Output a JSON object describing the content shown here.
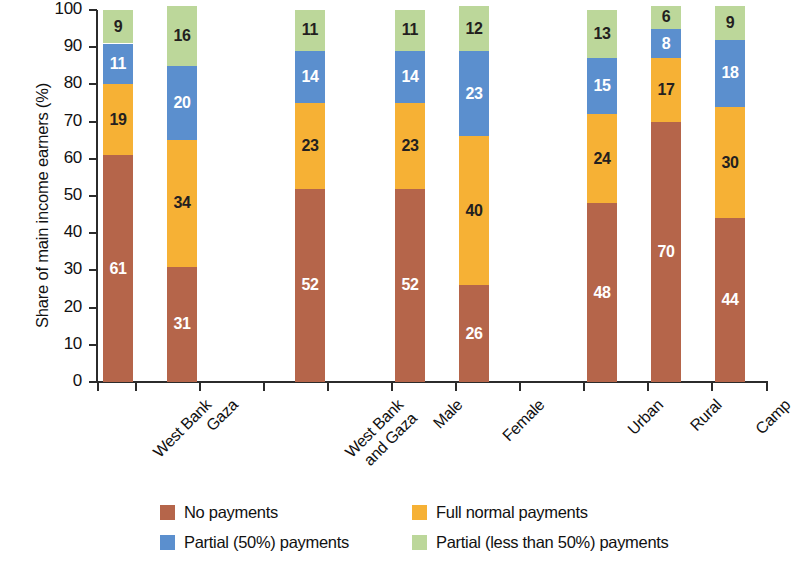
{
  "chart_data": {
    "type": "bar",
    "subtype": "stacked-100-percent",
    "title": "",
    "xlabel": "",
    "ylabel": "Share of main income earners (%)",
    "ylim": [
      0,
      100
    ],
    "ytick_values": [
      0,
      10,
      20,
      30,
      40,
      50,
      60,
      70,
      80,
      90,
      100
    ],
    "ytick_labels": [
      "0",
      "10",
      "20",
      "30",
      "40",
      "50",
      "60",
      "70",
      "80",
      "90",
      "100"
    ],
    "grid": false,
    "legend_position": "bottom",
    "categories": [
      "West Bank",
      "Gaza",
      "West Bank and Gaza",
      "Male",
      "Female",
      "Urban",
      "Rural",
      "Camp"
    ],
    "category_label_lines": [
      [
        "West Bank"
      ],
      [
        "Gaza"
      ],
      [
        "West Bank",
        "and Gaza"
      ],
      [
        "Male"
      ],
      [
        "Female"
      ],
      [
        "Urban"
      ],
      [
        "Rural"
      ],
      [
        "Camp"
      ]
    ],
    "series": [
      {
        "name": "No payments",
        "color": "#b5654a",
        "label_color": "light",
        "values": [
          61,
          31,
          52,
          52,
          26,
          48,
          70,
          44
        ]
      },
      {
        "name": "Full normal payments",
        "color": "#f6b135",
        "label_color": "dark",
        "values": [
          19,
          34,
          23,
          23,
          40,
          24,
          17,
          30
        ]
      },
      {
        "name": "Partial (50%) payments",
        "color": "#5b8fce",
        "label_color": "light",
        "values": [
          11,
          20,
          14,
          14,
          23,
          15,
          8,
          18
        ]
      },
      {
        "name": "Partial (less than 50%) payments",
        "color": "#bcd79a",
        "label_color": "dark",
        "values": [
          9,
          16,
          11,
          11,
          12,
          13,
          6,
          9
        ]
      }
    ],
    "legend": [
      {
        "label": "No payments",
        "color": "#b5654a"
      },
      {
        "label": "Full normal payments",
        "color": "#f6b135"
      },
      {
        "label": "Partial (50%) payments",
        "color": "#5b8fce"
      },
      {
        "label": "Partial (less than 50%) payments",
        "color": "#bcd79a"
      }
    ]
  },
  "layout": {
    "bar_x_positions": [
      103,
      167,
      295,
      395,
      459,
      587,
      651,
      715
    ],
    "bar_width": 30,
    "x_tick_positions": [
      97,
      135,
      199,
      263,
      327,
      391,
      455,
      519,
      583,
      647,
      711,
      766
    ],
    "legend_item_positions": [
      {
        "left": 0,
        "top": 0
      },
      {
        "left": 252,
        "top": 0
      },
      {
        "left": 0,
        "top": 30
      },
      {
        "left": 252,
        "top": 30
      }
    ]
  }
}
